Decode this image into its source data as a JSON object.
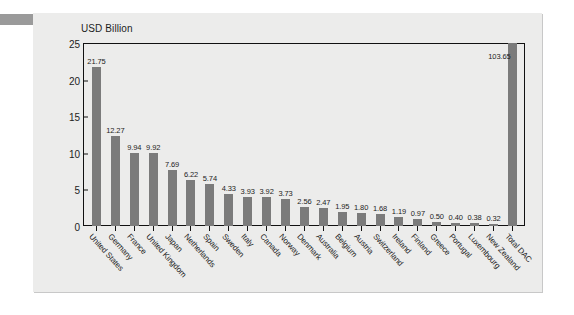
{
  "chart_data": {
    "type": "bar",
    "title": "",
    "axis_title": "USD Billion",
    "xlabel": "",
    "ylabel": "USD Billion",
    "ylim": [
      0,
      25
    ],
    "yticks": [
      0,
      5,
      10,
      15,
      20,
      25
    ],
    "grid": false,
    "legend": null,
    "bar_color": "#7b7b7b",
    "panel_color": "#ececeb",
    "note": "Final bar (Total DAC) value 103.65 exceeds the axis maximum and is drawn clipped at the top of the plot frame.",
    "categories": [
      "United States",
      "Germany",
      "France",
      "United Kingdom",
      "Japan",
      "Netherlands",
      "Spain",
      "Sweden",
      "Italy",
      "Canada",
      "Norway",
      "Denmark",
      "Australia",
      "Belgium",
      "Austria",
      "Switzerland",
      "Ireland",
      "Finland",
      "Greece",
      "Portugal",
      "Luxembourg",
      "New Zealand",
      "Total DAC"
    ],
    "values": [
      21.75,
      12.27,
      9.94,
      9.92,
      7.69,
      6.22,
      5.74,
      4.33,
      3.93,
      3.92,
      3.73,
      2.56,
      2.47,
      1.95,
      1.8,
      1.68,
      1.19,
      0.97,
      0.5,
      0.4,
      0.38,
      0.32,
      103.65
    ],
    "value_labels": [
      "21.75",
      "12.27",
      "9.94",
      "9.92",
      "7.69",
      "6.22",
      "5.74",
      "4.33",
      "3.93",
      "3.92",
      "3.73",
      "2.56",
      "2.47",
      "1.95",
      "1.80",
      "1.68",
      "1.19",
      "0.97",
      "0.50",
      "0.40",
      "0.38",
      "0.32",
      "103.65"
    ]
  }
}
